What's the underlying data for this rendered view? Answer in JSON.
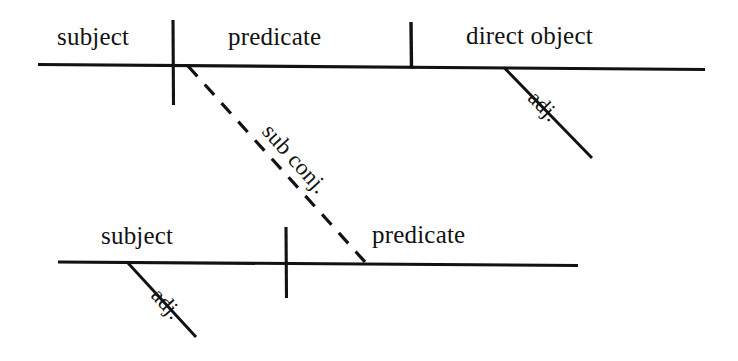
{
  "diagram": {
    "ink_color": "#121212",
    "background_color": "#ffffff",
    "clauses": [
      {
        "name": "independent-clause",
        "slots": [
          {
            "id": "subject-1",
            "label": "subject"
          },
          {
            "id": "predicate-1",
            "label": "predicate"
          },
          {
            "id": "direct-object-1",
            "label": "direct object"
          }
        ],
        "modifiers": [
          {
            "id": "adj-1",
            "label": "adj.",
            "attaches_to": "direct object"
          }
        ]
      },
      {
        "name": "subordinate-clause",
        "slots": [
          {
            "id": "subject-2",
            "label": "subject"
          },
          {
            "id": "predicate-2",
            "label": "predicate"
          }
        ],
        "modifiers": [
          {
            "id": "adj-2",
            "label": "adj.",
            "attaches_to": "subject"
          }
        ]
      }
    ],
    "connector": {
      "id": "sub-conj",
      "label": "sub conj.",
      "style": "dashed",
      "from": "predicate-1",
      "to": "predicate-2"
    }
  }
}
